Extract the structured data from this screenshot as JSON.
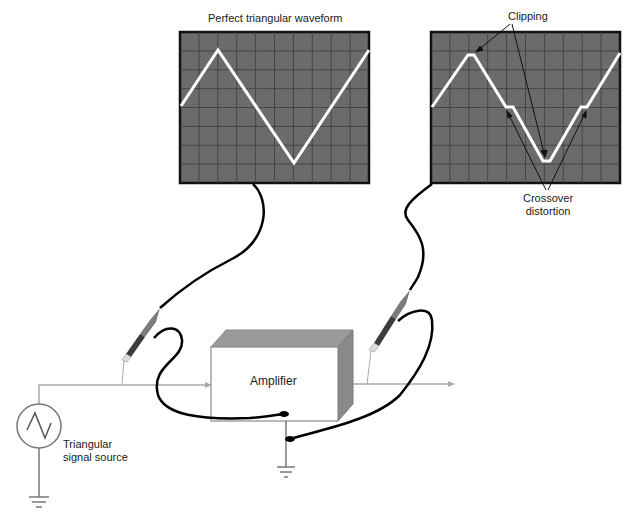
{
  "diagram": {
    "scope_left": {
      "title": "Perfect triangular waveform",
      "waveform": "perfect-triangle"
    },
    "scope_right": {
      "annotations": {
        "clipping": "Clipping",
        "crossover_line1": "Crossover",
        "crossover_line2": "distortion"
      },
      "waveform": "clipped-triangle-with-crossover-distortion"
    },
    "amplifier": {
      "label": "Amplifier"
    },
    "source": {
      "label_line1": "Triangular",
      "label_line2": "signal source",
      "icon": "ac-triangle-source-icon"
    },
    "colors": {
      "screen_bg": "#6b6b6b",
      "screen_border": "#111111",
      "grid": "#3c3c3c",
      "trace": "#ffffff",
      "wire": "#a9a9a9",
      "cable": "#000000",
      "amp_front": "#ffffff",
      "amp_top": "#9a9a9a",
      "amp_side": "#8a8a8a"
    }
  }
}
